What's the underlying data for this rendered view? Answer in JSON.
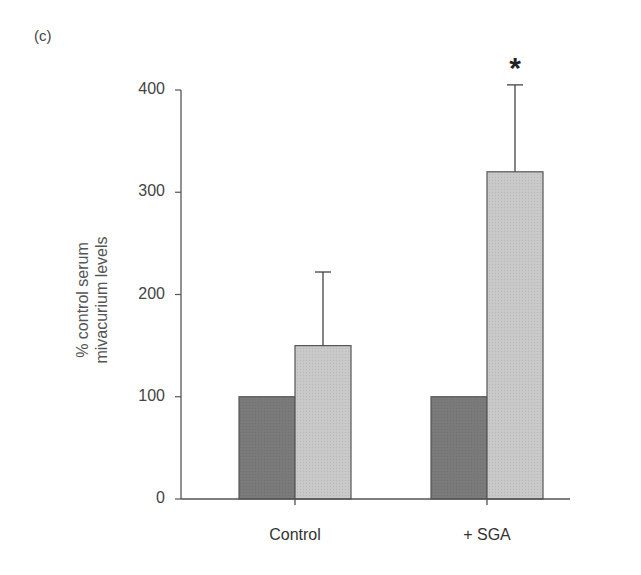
{
  "panel_label": "(c)",
  "chart_data": {
    "type": "bar",
    "title": "",
    "xlabel": "",
    "ylabel": "% control serum mivacurium levels",
    "ylabel_lines": [
      "% control serum",
      "mivacurium levels"
    ],
    "ylim": [
      0,
      400
    ],
    "yticks": [
      0,
      100,
      200,
      300,
      400
    ],
    "categories": [
      "Control",
      "+ SGA"
    ],
    "series": [
      {
        "name": "baseline (dark)",
        "color": "#7a7a7a",
        "values": [
          100,
          100
        ],
        "error": [
          null,
          null
        ]
      },
      {
        "name": "treated (light)",
        "color": "#c9c9c9",
        "values": [
          150,
          320
        ],
        "error": [
          72,
          85
        ]
      }
    ],
    "annotations": [
      {
        "category": "+ SGA",
        "series": 1,
        "text": "*"
      }
    ],
    "grid": false,
    "legend": "none"
  }
}
